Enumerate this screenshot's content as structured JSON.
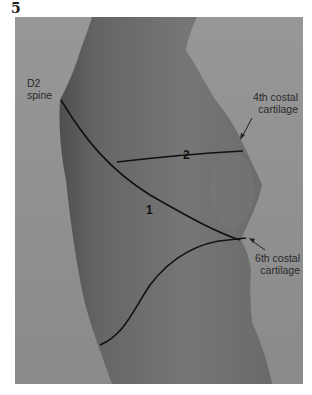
{
  "figure": {
    "number": "5",
    "labels": {
      "d2_spine": [
        "D2",
        "spine"
      ],
      "fourth_costal": [
        "4th costal",
        "cartilage"
      ],
      "sixth_costal": [
        "6th costal",
        "cartilage"
      ]
    },
    "line_numbers": {
      "line1": "1",
      "line2": "2"
    }
  },
  "colors": {
    "background": "#8d8d8d",
    "body": "#6f6f6f",
    "body_shadow": "#5a5a5a",
    "ink": "#111111"
  }
}
